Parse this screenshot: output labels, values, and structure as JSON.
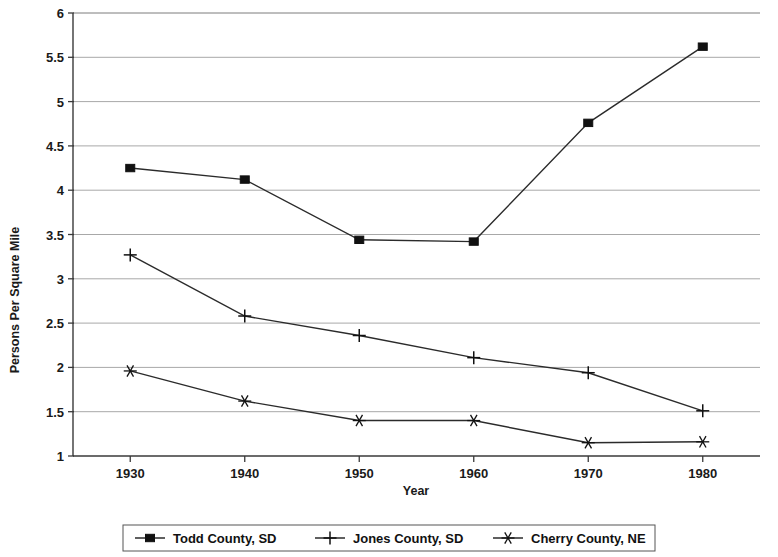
{
  "chart_data": {
    "type": "line",
    "title": "",
    "xlabel": "Year",
    "ylabel": "Persons Per Square Mile",
    "x": [
      1930,
      1940,
      1950,
      1960,
      1970,
      1980
    ],
    "xticklabels": [
      "1930",
      "1940",
      "1950",
      "1960",
      "1970",
      "1980"
    ],
    "xlim": [
      1925,
      1985
    ],
    "ylim": [
      1,
      6
    ],
    "yticks": [
      1,
      1.5,
      2,
      2.5,
      3,
      3.5,
      4,
      4.5,
      5,
      5.5,
      6
    ],
    "yticklabels": [
      "1",
      "1.5",
      "2",
      "2.5",
      "3",
      "3.5",
      "4",
      "4.5",
      "5",
      "5.5",
      "6"
    ],
    "grid": "horizontal",
    "legend_position": "bottom",
    "series": [
      {
        "name": "Todd County, SD",
        "marker": "filled-square",
        "color": "#111111",
        "values": [
          4.25,
          4.12,
          3.44,
          3.42,
          4.76,
          5.62
        ]
      },
      {
        "name": "Jones County, SD",
        "marker": "plus",
        "color": "#111111",
        "values": [
          3.27,
          2.58,
          2.36,
          2.11,
          1.94,
          1.51
        ]
      },
      {
        "name": "Cherry County, NE",
        "marker": "asterisk",
        "color": "#111111",
        "values": [
          1.96,
          1.62,
          1.4,
          1.4,
          1.15,
          1.16
        ]
      }
    ]
  },
  "legend": {
    "items": [
      {
        "label": "Todd County, SD",
        "marker": "filled-square"
      },
      {
        "label": "Jones County, SD",
        "marker": "plus"
      },
      {
        "label": "Cherry County, NE",
        "marker": "asterisk"
      }
    ]
  }
}
